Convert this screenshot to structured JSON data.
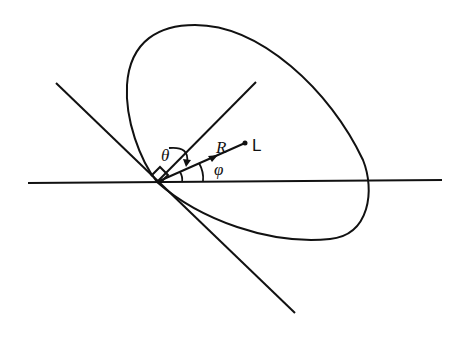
{
  "figure": {
    "labels": {
      "theta": "θ",
      "R": "R",
      "L": "L",
      "phi": "φ"
    },
    "colors": {
      "stroke": "#111111",
      "background": "#ffffff"
    },
    "elements": {
      "curve": "closed loop (ellipse-like) passing through origin",
      "horizontal_line": "horizontal reference axis",
      "tangent_line": "line through origin, descending left-to-right",
      "normal_line": "short line perpendicular to tangent at origin",
      "vector_R": "arrow from origin toward point L"
    }
  }
}
